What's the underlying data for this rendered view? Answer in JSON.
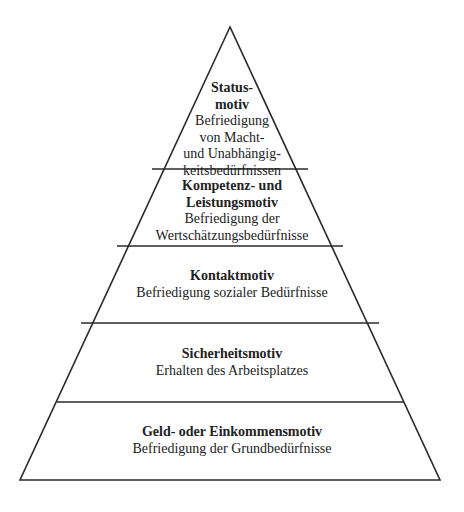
{
  "diagram": {
    "type": "pyramid",
    "line_color": "#2a2a2a",
    "background": "#ffffff",
    "levels": [
      {
        "id": "status",
        "title_lines": [
          "Status-",
          "motiv"
        ],
        "desc_lines": [
          "Befriedigung",
          "von Macht-",
          "und Unabhängig-",
          "keitsbedürfnissen"
        ]
      },
      {
        "id": "kompetenz",
        "title_lines": [
          "Kompetenz- und",
          "Leistungsmotiv"
        ],
        "desc_lines": [
          "Befriedigung der",
          "Wertschätzungsbedürfnisse"
        ]
      },
      {
        "id": "kontakt",
        "title_lines": [
          "Kontaktmotiv"
        ],
        "desc_lines": [
          "Befriedigung sozialer Bedürfnisse"
        ]
      },
      {
        "id": "sicherheit",
        "title_lines": [
          "Sicherheitsmotiv"
        ],
        "desc_lines": [
          "Erhalten des Arbeitsplatzes"
        ]
      },
      {
        "id": "geld",
        "title_lines": [
          "Geld- oder Einkommensmotiv"
        ],
        "desc_lines": [
          "Befriedigung der Grundbedürfnisse"
        ]
      }
    ]
  }
}
